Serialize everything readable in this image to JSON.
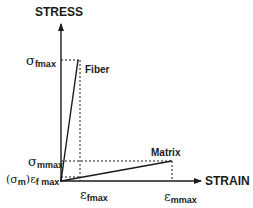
{
  "axes": {
    "y_label": "STRESS",
    "x_label": "STRAIN"
  },
  "curves": {
    "fiber_label": "Fiber",
    "matrix_label": "Matrix"
  },
  "y_ticks": {
    "sigma_fmax": {
      "symbol": "σ",
      "sub": "fmax"
    },
    "sigma_mmax": {
      "symbol": "σ",
      "sub": "mmax"
    },
    "sigma_m_at_efmax": {
      "prefix": "(σ",
      "sub": "m",
      "suffix": ")",
      "symbol2": "ε",
      "sub2": "f max"
    }
  },
  "x_ticks": {
    "eps_fmax": {
      "symbol": "ε",
      "sub": "fmax"
    },
    "eps_mmax": {
      "symbol": "ε",
      "sub": "mmax"
    }
  },
  "colors": {
    "ink": "#1a1a1a",
    "background": "#ffffff"
  }
}
